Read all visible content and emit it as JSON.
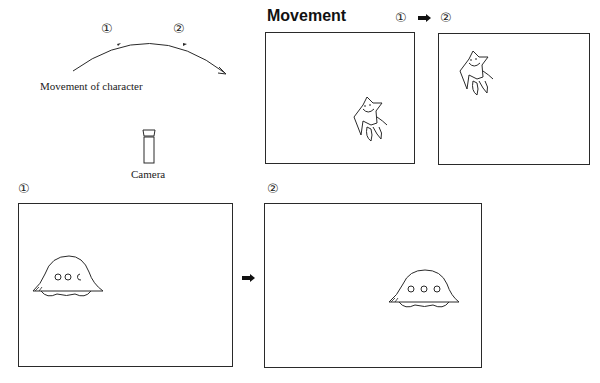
{
  "diagram": {
    "trajectory": {
      "caption": "Movement of character",
      "marker_1": "①",
      "marker_2": "②",
      "arrow_icon": "curved-arrow-icon"
    },
    "camera": {
      "label": "Camera",
      "icon": "camera-icon"
    },
    "movement_panel": {
      "title": "Movement",
      "step_from": "①",
      "step_to": "②",
      "arrow_icon": "right-arrow-icon",
      "frames": [
        {
          "id": "frame-1",
          "character": "star-character",
          "position": "bottom-right"
        },
        {
          "id": "frame-2",
          "character": "star-character",
          "position": "top-left"
        }
      ]
    },
    "ufo_sequence": {
      "frames": [
        {
          "label": "①",
          "character": "ufo",
          "position": "left"
        },
        {
          "label": "②",
          "character": "ufo",
          "position": "right"
        }
      ],
      "arrow_icon": "right-arrow-icon"
    },
    "colors": {
      "line": "#2a2a2a",
      "background": "#ffffff"
    }
  }
}
